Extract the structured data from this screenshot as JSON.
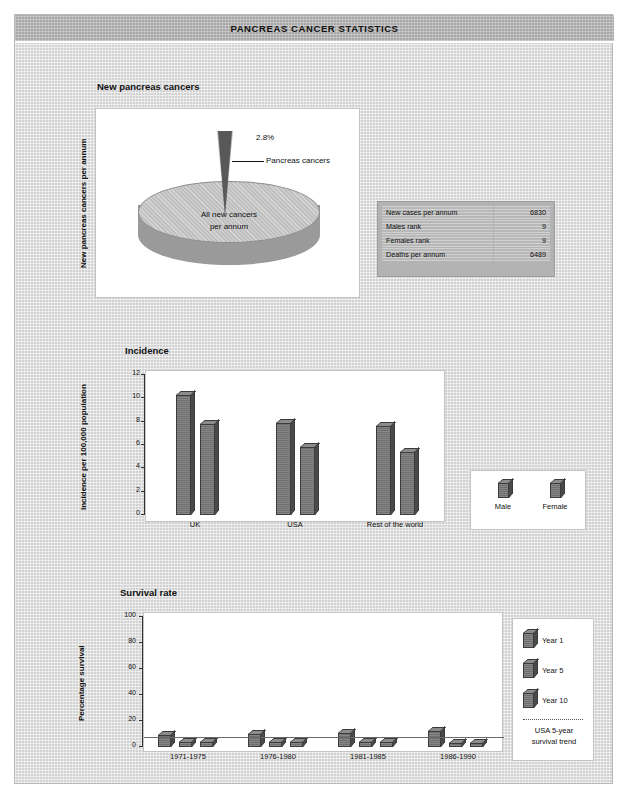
{
  "header": {
    "title": "PANCREAS CANCER STATISTICS"
  },
  "sections": {
    "pie": {
      "title": "New pancreas cancers",
      "axis_label": "New pancreas cancers per annum",
      "callout_pct": "2.8%",
      "callout_label": "Pancreas cancers",
      "inner_label_line1": "All new cancers",
      "inner_label_line2": "per annum"
    },
    "stats": {
      "rows": [
        {
          "label": "New cases per annum",
          "value": "6830"
        },
        {
          "label": "Males rank",
          "value": "9"
        },
        {
          "label": "Females rank",
          "value": "9"
        },
        {
          "label": "Deaths per annum",
          "value": "6489"
        }
      ]
    },
    "incidence": {
      "title": "Incidence",
      "axis_label": "Incidence per 100,000 population",
      "legend": [
        {
          "label": "Male"
        },
        {
          "label": "Female"
        }
      ]
    },
    "survival": {
      "title": "Survival rate",
      "axis_label": "Percentage survival",
      "legend": [
        {
          "label": "Year 1"
        },
        {
          "label": "Year 5"
        },
        {
          "label": "Year 10"
        }
      ],
      "trend_note_line1": "USA 5-year",
      "trend_note_line2": "survival trend"
    }
  },
  "chart_data": [
    {
      "type": "pie",
      "title": "New pancreas cancers",
      "ylabel": "New pancreas cancers per annum",
      "slices": [
        {
          "label": "Pancreas cancers",
          "value": 2.8
        },
        {
          "label": "All new cancers per annum",
          "value": 97.2
        }
      ],
      "annotations": [
        "2.8%",
        "Pancreas cancers",
        "All new cancers per annum"
      ]
    },
    {
      "type": "bar",
      "title": "Incidence",
      "xlabel": "",
      "ylabel": "Incidence per 100,000 population",
      "ylim": [
        0,
        12
      ],
      "yticks": [
        0,
        2,
        4,
        6,
        8,
        10,
        12
      ],
      "grid": false,
      "legend_position": "right",
      "categories": [
        "UK",
        "USA",
        "Rest of the world"
      ],
      "series": [
        {
          "name": "Male",
          "values": [
            10.3,
            7.9,
            7.6
          ]
        },
        {
          "name": "Female",
          "values": [
            7.8,
            5.8,
            5.4
          ]
        }
      ]
    },
    {
      "type": "bar",
      "title": "Survival rate",
      "xlabel": "",
      "ylabel": "Percentage survival",
      "ylim": [
        0,
        100
      ],
      "yticks": [
        0,
        20,
        40,
        60,
        80,
        100
      ],
      "grid": false,
      "legend_position": "right",
      "categories": [
        "1971-1975",
        "1976-1980",
        "1981-1985",
        "1986-1990"
      ],
      "series": [
        {
          "name": "Year 1",
          "values": [
            9,
            10,
            11,
            12
          ]
        },
        {
          "name": "Year 5",
          "values": [
            4,
            4,
            4,
            3
          ]
        },
        {
          "name": "Year 10",
          "values": [
            4,
            4,
            4,
            3
          ]
        }
      ],
      "reference_line": {
        "name": "USA 5-year survival trend",
        "value": 8
      }
    }
  ],
  "colors": {
    "page_bg": "#d2d2d2",
    "title_bar": "#a8a8a8",
    "panel_bg": "#ffffff",
    "bar_fill": "#6f6f6f",
    "pie_slice": "#585858",
    "pie_body": "#c0c0c0"
  }
}
